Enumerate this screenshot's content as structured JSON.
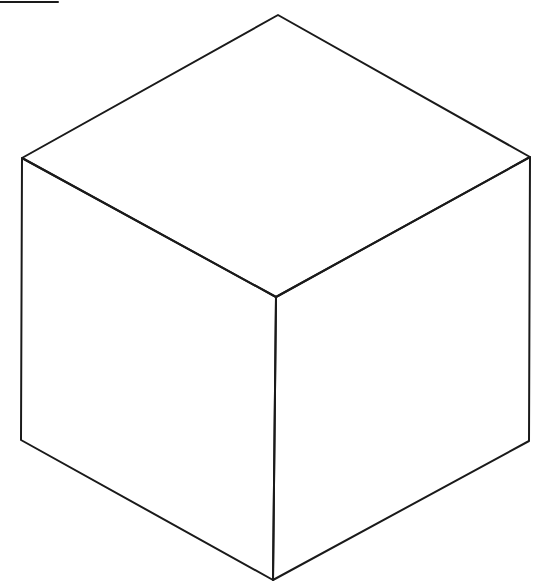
{
  "diagram": {
    "type": "isometric-cube-wireframe",
    "stroke_color": "#1a1a1a",
    "background": "#ffffff",
    "stroke_width": 2,
    "vertices": {
      "top": [
        278,
        15
      ],
      "left_top": [
        22,
        158
      ],
      "right_top": [
        530,
        157
      ],
      "center": [
        276,
        297
      ],
      "left_bottom": [
        21,
        440
      ],
      "right_bottom": [
        529,
        441
      ],
      "bottom": [
        273,
        580
      ]
    },
    "top_left_mark": {
      "x1": 0,
      "y1": 2,
      "x2": 58,
      "y2": 2
    }
  }
}
